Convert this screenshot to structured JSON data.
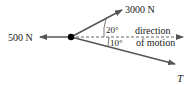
{
  "diagram": {
    "type": "force-diagram",
    "forces": [
      {
        "label": "3000 N",
        "angle_label": "20°",
        "direction": "up-right"
      },
      {
        "label": "500 N",
        "direction": "left"
      },
      {
        "label": "T",
        "angle_label": "10°",
        "direction": "down-right"
      }
    ],
    "reference_line": {
      "label_line1": "direction",
      "label_line2": "of motion"
    },
    "colors": {
      "arrow": "#555555",
      "dot": "#000000",
      "text": "#222222"
    }
  }
}
